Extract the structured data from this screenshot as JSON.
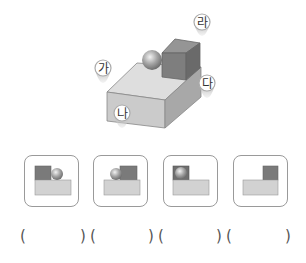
{
  "figure": {
    "markers": [
      {
        "id": "ga",
        "label": "가"
      },
      {
        "id": "na",
        "label": "나"
      },
      {
        "id": "da",
        "label": "다"
      },
      {
        "id": "ra",
        "label": "라"
      }
    ],
    "colors": {
      "box_top": "#dcdcdc",
      "box_front": "#c9c9c9",
      "box_side": "#a9a9a9",
      "cube_front": "#7d7d7d",
      "cube_top": "#959595",
      "cube_side": "#6a6a6a",
      "sphere": "#9c9c9c",
      "marker": "#a8a8a8"
    }
  },
  "options": [
    {
      "id": "view-1",
      "description": "cube left, sphere right, on base"
    },
    {
      "id": "view-2",
      "description": "sphere left, cube right, on base"
    },
    {
      "id": "view-3",
      "description": "sphere in front of cube at left, on base"
    },
    {
      "id": "view-4",
      "description": "cube at right on base, sphere hidden"
    }
  ],
  "answers": {
    "open": "(",
    "close": ")",
    "blanks": [
      "",
      "",
      "",
      ""
    ]
  }
}
